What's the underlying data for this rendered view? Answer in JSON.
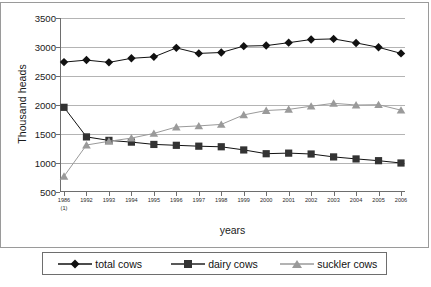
{
  "chart_data": {
    "type": "line",
    "title": "",
    "xlabel": "years",
    "ylabel": "Thousand heads",
    "ylim": [
      500,
      3500
    ],
    "ytick_step": 500,
    "yticks": [
      500,
      1000,
      1500,
      2000,
      2500,
      3000,
      3500
    ],
    "grid": true,
    "legend_position": "bottom",
    "categories": [
      "1986",
      "1992",
      "1993",
      "1994",
      "1995",
      "1996",
      "1997",
      "1998",
      "1999",
      "2000",
      "2001",
      "2002",
      "2003",
      "2004",
      "2005",
      "2006"
    ],
    "category_footnotes": {
      "1986": "(1)"
    },
    "series": [
      {
        "name": "total cows",
        "marker": "diamond",
        "color": "#111111",
        "values": [
          2740,
          2775,
          2735,
          2805,
          2830,
          2985,
          2890,
          2905,
          3015,
          3025,
          3075,
          3130,
          3140,
          3070,
          2995,
          2890
        ]
      },
      {
        "name": "dairy cows",
        "marker": "square",
        "color": "#333333",
        "values": [
          1960,
          1450,
          1390,
          1360,
          1320,
          1305,
          1290,
          1280,
          1225,
          1160,
          1170,
          1155,
          1105,
          1070,
          1040,
          1000
        ]
      },
      {
        "name": "suckler cows",
        "marker": "triangle",
        "color": "#9a9a9a",
        "values": [
          770,
          1310,
          1375,
          1430,
          1510,
          1620,
          1640,
          1665,
          1830,
          1905,
          1925,
          1980,
          2030,
          2000,
          2005,
          1910
        ]
      }
    ]
  },
  "axes": {
    "y_title": "Thousand heads",
    "x_title": "years"
  },
  "legend": {
    "items": [
      {
        "label": "total cows",
        "marker": "diamond-marker-icon",
        "color": "#111111"
      },
      {
        "label": "dairy cows",
        "marker": "square-marker-icon",
        "color": "#333333"
      },
      {
        "label": "suckler cows",
        "marker": "triangle-marker-icon",
        "color": "#9a9a9a"
      }
    ]
  }
}
